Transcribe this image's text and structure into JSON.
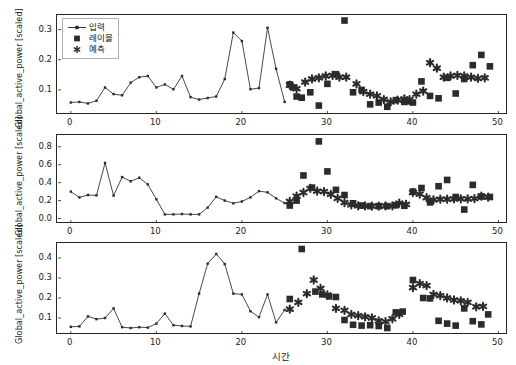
{
  "figure": {
    "background": "#ffffff",
    "foreground": "#262626",
    "marker_color": "#2b2b2b",
    "line_color": "#333333"
  },
  "legend": {
    "items": [
      {
        "label": "입력",
        "marker": "line-with-dot"
      },
      {
        "label": "레이블",
        "marker": "square"
      },
      {
        "label": "예측",
        "marker": "asterisk"
      }
    ]
  },
  "axis_titles": {
    "y": "Global_active_power [scaled]",
    "x": "시간"
  },
  "chart_data": [
    {
      "type": "line",
      "title": "",
      "xlabel": "",
      "ylabel": "Global_active_power [scaled]",
      "xlim": [
        -1.5,
        51.0
      ],
      "ylim": [
        0.02,
        0.345
      ],
      "xticks": [
        0,
        10,
        20,
        30,
        40,
        50
      ],
      "yticks": [
        0.1,
        0.2,
        0.3
      ],
      "grid": false,
      "legend_position": "upper-left",
      "series": [
        {
          "name": "입력",
          "type": "line",
          "x": [
            0,
            1,
            2,
            3,
            4,
            5,
            6,
            7,
            8,
            9,
            10,
            11,
            12,
            13,
            14,
            15,
            16,
            17,
            18,
            19,
            20,
            21,
            22,
            23,
            24,
            25
          ],
          "y": [
            0.058,
            0.06,
            0.055,
            0.064,
            0.108,
            0.086,
            0.082,
            0.124,
            0.142,
            0.146,
            0.108,
            0.118,
            0.102,
            0.146,
            0.076,
            0.068,
            0.073,
            0.078,
            0.136,
            0.29,
            0.262,
            0.102,
            0.106,
            0.306,
            0.17,
            0.06
          ]
        },
        {
          "name": "레이블",
          "type": "scatter",
          "marker": "square",
          "x": [
            25.6,
            26.0,
            26.4,
            27.0,
            28.0,
            29.0,
            30.0,
            31.0,
            32.0,
            33.0,
            34.0,
            35.0,
            36.0,
            37.0,
            38.0,
            39.0,
            39.5,
            40.0,
            41.0,
            42.0,
            43.0,
            44.0,
            45.0,
            46.0,
            47.0,
            48.0,
            49.0
          ],
          "y": [
            0.118,
            0.108,
            0.078,
            0.074,
            0.092,
            0.048,
            0.12,
            0.152,
            0.33,
            0.092,
            0.1,
            0.052,
            0.058,
            0.044,
            0.066,
            0.06,
            0.062,
            0.058,
            0.128,
            0.08,
            0.072,
            0.14,
            0.088,
            0.136,
            0.182,
            0.216,
            0.178
          ]
        },
        {
          "name": "예측",
          "type": "scatter",
          "marker": "asterisk",
          "x": [
            25.6,
            26.4,
            27.4,
            28.2,
            29.0,
            29.8,
            30.6,
            31.4,
            32.2,
            33.4,
            34.2,
            35.0,
            35.8,
            36.6,
            37.4,
            38.2,
            39.0,
            39.6,
            40.4,
            41.2,
            42.0,
            42.8,
            43.6,
            44.4,
            45.2,
            46.0,
            46.8,
            47.6,
            48.4
          ],
          "y": [
            0.116,
            0.104,
            0.126,
            0.136,
            0.14,
            0.146,
            0.148,
            0.142,
            0.142,
            0.12,
            0.094,
            0.086,
            0.08,
            0.068,
            0.06,
            0.066,
            0.07,
            0.068,
            0.086,
            0.096,
            0.19,
            0.172,
            0.142,
            0.146,
            0.148,
            0.146,
            0.142,
            0.138,
            0.14
          ]
        }
      ]
    },
    {
      "type": "line",
      "title": "",
      "xlabel": "",
      "ylabel": "Global_active_power [scaled]",
      "xlim": [
        -1.5,
        51.0
      ],
      "ylim": [
        -0.05,
        0.92
      ],
      "xticks": [
        0,
        10,
        20,
        30,
        40,
        50
      ],
      "yticks": [
        0.0,
        0.2,
        0.4,
        0.6,
        0.8
      ],
      "grid": false,
      "legend_position": "none",
      "series": [
        {
          "name": "입력",
          "type": "line",
          "x": [
            0,
            1,
            2,
            3,
            4,
            5,
            6,
            7,
            8,
            9,
            10,
            11,
            12,
            13,
            14,
            15,
            16,
            17,
            18,
            19,
            20,
            21,
            22,
            23,
            24,
            25
          ],
          "y": [
            0.3,
            0.235,
            0.262,
            0.258,
            0.62,
            0.255,
            0.462,
            0.415,
            0.455,
            0.38,
            0.215,
            0.046,
            0.046,
            0.05,
            0.046,
            0.046,
            0.122,
            0.242,
            0.2,
            0.17,
            0.19,
            0.236,
            0.305,
            0.292,
            0.225,
            0.172
          ]
        },
        {
          "name": "레이블",
          "type": "scatter",
          "marker": "square",
          "x": [
            25.6,
            26.4,
            27.2,
            28.2,
            29.0,
            30.0,
            31.0,
            32.0,
            33.0,
            34.0,
            35.0,
            36.0,
            37.0,
            38.0,
            39.0,
            40.0,
            41.0,
            42.0,
            43.0,
            44.0,
            45.0,
            46.0,
            47.0,
            48.0,
            49.0
          ],
          "y": [
            0.145,
            0.2,
            0.48,
            0.345,
            0.86,
            0.525,
            0.32,
            0.262,
            0.17,
            0.145,
            0.138,
            0.138,
            0.138,
            0.148,
            0.142,
            0.3,
            0.34,
            0.18,
            0.36,
            0.43,
            0.24,
            0.1,
            0.375,
            0.245,
            0.24
          ]
        },
        {
          "name": "예측",
          "type": "scatter",
          "marker": "asterisk",
          "x": [
            25.6,
            26.4,
            27.2,
            28.0,
            28.8,
            29.6,
            30.4,
            31.2,
            32.0,
            32.8,
            33.6,
            34.4,
            35.2,
            36.0,
            36.8,
            37.6,
            38.4,
            39.2,
            40.0,
            40.8,
            41.6,
            42.4,
            43.2,
            44.0,
            44.8,
            45.6,
            46.4,
            47.2,
            48.0,
            48.8
          ],
          "y": [
            0.19,
            0.25,
            0.29,
            0.335,
            0.305,
            0.3,
            0.27,
            0.225,
            0.178,
            0.152,
            0.142,
            0.14,
            0.138,
            0.138,
            0.14,
            0.142,
            0.172,
            0.158,
            0.29,
            0.272,
            0.232,
            0.208,
            0.215,
            0.215,
            0.218,
            0.22,
            0.218,
            0.222,
            0.248,
            0.238
          ]
        }
      ]
    },
    {
      "type": "line",
      "title": "",
      "xlabel": "시간",
      "ylabel": "Global_active_power [scaled]",
      "xlim": [
        -1.5,
        51.0
      ],
      "ylim": [
        0.02,
        0.47
      ],
      "xticks": [
        0,
        10,
        20,
        30,
        40,
        50
      ],
      "yticks": [
        0.1,
        0.2,
        0.3,
        0.4
      ],
      "grid": false,
      "legend_position": "none",
      "series": [
        {
          "name": "입력",
          "type": "line",
          "x": [
            0,
            1,
            2,
            3,
            4,
            5,
            6,
            7,
            8,
            9,
            10,
            11,
            12,
            13,
            14,
            15,
            16,
            17,
            18,
            19,
            20,
            21,
            22,
            23,
            24,
            25
          ],
          "y": [
            0.056,
            0.058,
            0.108,
            0.094,
            0.1,
            0.148,
            0.054,
            0.05,
            0.054,
            0.052,
            0.072,
            0.122,
            0.064,
            0.06,
            0.058,
            0.222,
            0.372,
            0.42,
            0.37,
            0.222,
            0.218,
            0.134,
            0.104,
            0.218,
            0.078,
            0.14
          ]
        },
        {
          "name": "레이블",
          "type": "scatter",
          "marker": "square",
          "x": [
            25.6,
            27.0,
            28.6,
            29.4,
            30.2,
            31.0,
            32.0,
            33.0,
            34.0,
            35.0,
            36.0,
            37.0,
            38.0,
            38.8,
            40.0,
            41.2,
            42.0,
            43.0,
            44.0,
            45.0,
            46.0,
            47.0,
            48.0,
            48.8
          ],
          "y": [
            0.195,
            0.445,
            0.232,
            0.218,
            0.208,
            0.205,
            0.09,
            0.066,
            0.062,
            0.064,
            0.06,
            0.05,
            0.128,
            0.132,
            0.29,
            0.2,
            0.198,
            0.086,
            0.072,
            0.062,
            0.148,
            0.084,
            0.068,
            0.118
          ]
        },
        {
          "name": "예측",
          "type": "scatter",
          "marker": "asterisk",
          "x": [
            25.6,
            26.6,
            27.6,
            28.4,
            29.2,
            30.0,
            31.0,
            32.0,
            32.8,
            33.6,
            34.4,
            35.2,
            36.0,
            36.8,
            37.6,
            38.4,
            40.0,
            40.8,
            41.6,
            42.4,
            43.2,
            44.0,
            44.8,
            45.6,
            46.4,
            47.4,
            48.2
          ],
          "y": [
            0.144,
            0.178,
            0.222,
            0.29,
            0.248,
            0.215,
            0.148,
            0.138,
            0.118,
            0.112,
            0.106,
            0.1,
            0.086,
            0.082,
            0.096,
            0.118,
            0.252,
            0.272,
            0.262,
            0.218,
            0.212,
            0.2,
            0.19,
            0.186,
            0.178,
            0.156,
            0.158
          ]
        }
      ]
    }
  ]
}
